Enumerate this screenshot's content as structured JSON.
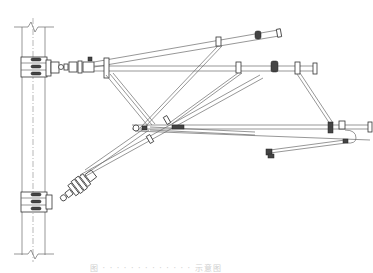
{
  "figure": {
    "type": "technical-line-drawing",
    "caption": "图 · · · · · · · · · · · · · 示意图",
    "caption_legible": false
  },
  "components": {
    "pole": {
      "label": "pole",
      "break_marks": 2
    },
    "upper_base": {
      "label": "upper-pole-bracket",
      "bolts": 3
    },
    "lower_base": {
      "label": "lower-pole-bracket",
      "bolts": 3
    },
    "upper_insulator": {
      "label": "horizontal-insulator"
    },
    "lower_insulator": {
      "label": "inclined-insulator"
    },
    "tubes": [
      "upper-inclined-tube",
      "horizontal-tube",
      "diagonal-brace",
      "lower-horizontal-tube",
      "steady-arm"
    ],
    "clamps": 10
  },
  "colors": {
    "line": "#6a6a6a",
    "dark_fitting": "#444444",
    "background": "#ffffff"
  }
}
